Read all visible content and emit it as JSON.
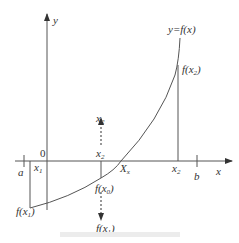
{
  "diagram": {
    "axes": {
      "x_label": "x",
      "y_label": "y",
      "origin_label": "0"
    },
    "curve_label": "y=f(x)",
    "labels": {
      "a": "a",
      "b": "b",
      "x1": "x",
      "x1_sub": "1",
      "x2_top": "x",
      "x2_top_sub": "2",
      "x2_mid": "x",
      "x2_mid_sub": "2",
      "x2_axis": "x",
      "x2_axis_sub": "2",
      "Xx": "X",
      "Xx_sub": "x",
      "fx2": "f(x",
      "fx2_sub": "2",
      "fx0": "f(x",
      "fx0_sub": "0",
      "fx1_left": "f(x",
      "fx1_left_sub": "1",
      "fx1_bottom": "f(x",
      "fx1_bottom_sub": "1",
      "close": ")"
    },
    "colors": {
      "stroke": "#555555",
      "text": "#333333",
      "caption": "#ececec"
    }
  }
}
